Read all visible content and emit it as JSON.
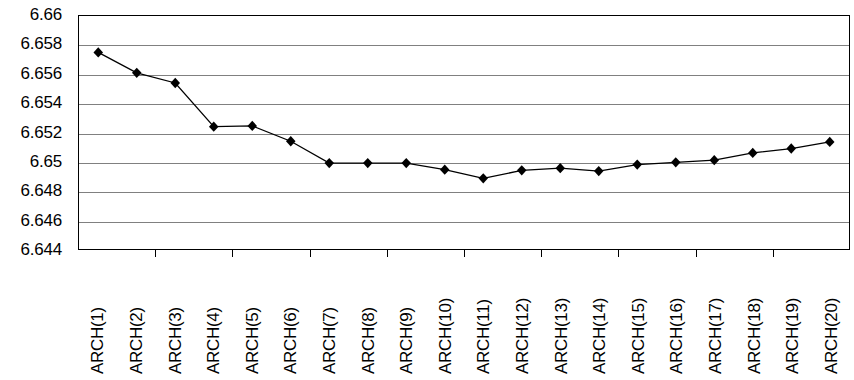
{
  "chart_data": {
    "type": "line",
    "title": "",
    "xlabel": "",
    "ylabel": "",
    "categories": [
      "ARCH(1)",
      "ARCH(2)",
      "ARCH(3)",
      "ARCH(4)",
      "ARCH(5)",
      "ARCH(6)",
      "ARCH(7)",
      "ARCH(8)",
      "ARCH(9)",
      "ARCH(10)",
      "ARCH(11)",
      "ARCH(12)",
      "ARCH(13)",
      "ARCH(14)",
      "ARCH(15)",
      "ARCH(16)",
      "ARCH(17)",
      "ARCH(18)",
      "ARCH(19)",
      "ARCH(20)"
    ],
    "values": [
      6.6575,
      6.6561,
      6.6554,
      6.6524,
      6.65245,
      6.6514,
      6.6499,
      6.6499,
      6.6499,
      6.64945,
      6.64885,
      6.6494,
      6.64955,
      6.64935,
      6.6498,
      6.64995,
      6.6501,
      6.6506,
      6.6509,
      6.65135
    ],
    "ylim": [
      6.644,
      6.66
    ],
    "ytick_labels": [
      "6.66",
      "6.658",
      "6.656",
      "6.654",
      "6.652",
      "6.65",
      "6.648",
      "6.646",
      "6.644"
    ],
    "ytick_values": [
      6.66,
      6.658,
      6.656,
      6.654,
      6.652,
      6.65,
      6.648,
      6.646,
      6.644
    ],
    "ytick_step": 0.002,
    "grid": true,
    "legend": "none",
    "marker": "diamond",
    "marker_color": "#000000",
    "line_color": "#000000",
    "grid_color": "#808080",
    "axis_color": "#000000",
    "background": "#ffffff"
  }
}
